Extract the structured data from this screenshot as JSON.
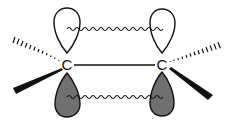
{
  "diagram": {
    "type": "pi-bond-orbital-diagram",
    "atoms": [
      {
        "label": "C",
        "x": 67,
        "y": 67
      },
      {
        "label": "C",
        "x": 162,
        "y": 67
      }
    ],
    "colors": {
      "line": "#111111",
      "filled_lobe": "#707070",
      "empty_lobe": "#ffffff",
      "background": "#ffffff"
    },
    "bonds": [
      {
        "kind": "sigma",
        "from": "C1",
        "to": "C2"
      },
      {
        "kind": "hashed",
        "atom": "C1",
        "direction": "upper-left"
      },
      {
        "kind": "wedge",
        "atom": "C1",
        "direction": "lower-left"
      },
      {
        "kind": "hashed",
        "atom": "C2",
        "direction": "upper-right"
      },
      {
        "kind": "wedge",
        "atom": "C2",
        "direction": "lower-right"
      }
    ],
    "orbitals": [
      {
        "atom": "C1",
        "lobe": "top",
        "shading": "empty"
      },
      {
        "atom": "C1",
        "lobe": "bottom",
        "shading": "filled"
      },
      {
        "atom": "C2",
        "lobe": "top",
        "shading": "empty"
      },
      {
        "atom": "C2",
        "lobe": "bottom",
        "shading": "filled"
      }
    ],
    "overlap_lines": [
      {
        "position": "top",
        "style": "wavy"
      },
      {
        "position": "bottom",
        "style": "wavy"
      }
    ]
  }
}
